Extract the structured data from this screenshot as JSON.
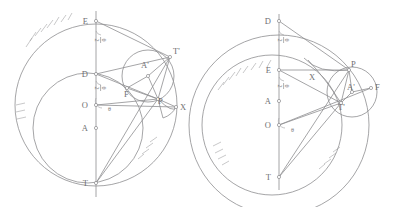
{
  "figure": {
    "stroke_color": "#8e8e90",
    "background": "#ffffff",
    "panels": [
      {
        "id": "left-panel",
        "name": "left-construction",
        "points": [
          {
            "key": "E",
            "label": "E",
            "x": 96,
            "y": 21
          },
          {
            "key": "D",
            "label": "D",
            "x": 96,
            "y": 74
          },
          {
            "key": "O",
            "label": "O",
            "x": 96,
            "y": 105
          },
          {
            "key": "A",
            "label": "A",
            "x": 96,
            "y": 128
          },
          {
            "key": "T",
            "label": "T",
            "x": 96,
            "y": 183
          },
          {
            "key": "Tp",
            "label": "T'",
            "x": 166,
            "y": 59
          },
          {
            "key": "Ap",
            "label": "A'",
            "x": 146,
            "y": 70
          },
          {
            "key": "F",
            "label": "F",
            "x": 127,
            "y": 92
          },
          {
            "key": "P",
            "label": "P",
            "x": 155,
            "y": 99
          },
          {
            "key": "X",
            "label": "X",
            "x": 180,
            "y": 108
          }
        ],
        "angle_labels": [
          {
            "key": "theta_half_upper",
            "num": "θ",
            "den": "2",
            "x": 101,
            "y": 40
          },
          {
            "key": "theta_half_lower",
            "num": "θ",
            "den": "2",
            "x": 101,
            "y": 88
          },
          {
            "key": "theta_at_O",
            "num": "θ",
            "den": "",
            "x": 109,
            "y": 110
          }
        ]
      },
      {
        "id": "right-panel",
        "name": "right-construction",
        "points": [
          {
            "key": "D",
            "label": "D",
            "x": 279,
            "y": 21
          },
          {
            "key": "E",
            "label": "E",
            "x": 279,
            "y": 70
          },
          {
            "key": "A",
            "label": "A",
            "x": 279,
            "y": 101
          },
          {
            "key": "O",
            "label": "O",
            "x": 279,
            "y": 125
          },
          {
            "key": "T",
            "label": "T",
            "x": 279,
            "y": 177
          },
          {
            "key": "P",
            "label": "P",
            "x": 347,
            "y": 72
          },
          {
            "key": "Ap",
            "label": "A'",
            "x": 348,
            "y": 92
          },
          {
            "key": "F",
            "label": "F",
            "x": 372,
            "y": 90
          },
          {
            "key": "Tp",
            "label": "T'",
            "x": 340,
            "y": 104
          },
          {
            "key": "X",
            "label": "X",
            "x": 312,
            "y": 77
          }
        ],
        "angle_labels": [
          {
            "key": "theta_half_upper",
            "num": "θ",
            "den": "2",
            "x": 284,
            "y": 40
          },
          {
            "key": "theta_half_lower",
            "num": "θ",
            "den": "2",
            "x": 284,
            "y": 86
          },
          {
            "key": "theta_at_O",
            "num": "θ",
            "den": "",
            "x": 292,
            "y": 131
          }
        ]
      }
    ]
  }
}
